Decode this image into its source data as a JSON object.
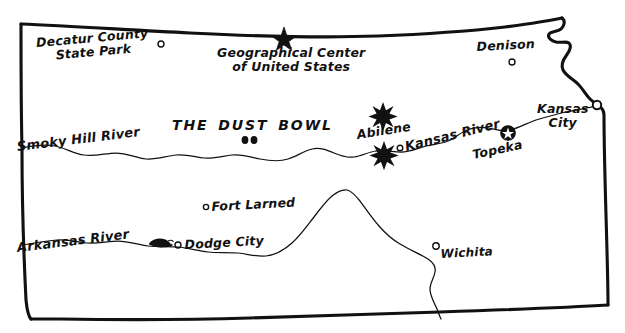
{
  "map": {
    "title": "Kansas",
    "ink_color": "#111111",
    "paper_color": "#ffffff",
    "places": [
      {
        "id": "decatur-county-state-park",
        "label_line1": "Decatur County",
        "label_line2": "State Park",
        "marker": "open-circle",
        "marker_x": 161,
        "marker_y": 44,
        "label_x": 38,
        "label_y": 36
      },
      {
        "id": "geographical-center",
        "label_line1": "Geographical Center",
        "label_line2": "of United States",
        "marker": "solid-star",
        "marker_x": 284,
        "marker_y": 36,
        "label_x": 217,
        "label_y": 46
      },
      {
        "id": "denison",
        "label_line1": "Denison",
        "marker": "open-circle",
        "marker_x": 512,
        "marker_y": 62,
        "label_x": 477,
        "label_y": 40
      },
      {
        "id": "abilene",
        "label_line1": "Abilene",
        "marker": "open-circle",
        "marker_x": 400,
        "marker_y": 148,
        "label_x": 358,
        "label_y": 128
      },
      {
        "id": "topeka",
        "label_line1": "Topeka",
        "marker": "circled-star",
        "marker_x": 508,
        "marker_y": 133,
        "label_x": 474,
        "label_y": 148
      },
      {
        "id": "kansas-city",
        "label_line1": "Kansas",
        "label_line2": "City",
        "marker": "open-circle",
        "marker_x": 597,
        "marker_y": 105,
        "label_x": 537,
        "label_y": 102
      },
      {
        "id": "fort-larned",
        "label_line1": "Fort Larned",
        "marker": "open-circle",
        "marker_x": 206,
        "marker_y": 207,
        "label_x": 212,
        "label_y": 200
      },
      {
        "id": "dodge-city",
        "label_line1": "Dodge City",
        "marker": "open-circle",
        "marker_x": 178,
        "marker_y": 245,
        "label_x": 185,
        "label_y": 238
      },
      {
        "id": "wichita",
        "label_line1": "Wichita",
        "marker": "open-circle",
        "marker_x": 436,
        "marker_y": 246,
        "label_x": 441,
        "label_y": 248
      }
    ],
    "rivers": [
      {
        "id": "smoky-hill-river",
        "label": "Smoky Hill River",
        "label_x": 18,
        "label_y": 140
      },
      {
        "id": "kansas-river",
        "label": "Kansas River",
        "label_x": 407,
        "label_y": 140
      },
      {
        "id": "arkansas-river",
        "label": "Arkansas River",
        "label_x": 18,
        "label_y": 241
      }
    ],
    "regions": [
      {
        "id": "the-dust-bowl",
        "label": "THE DUST BOWL",
        "label_x": 172,
        "label_y": 118,
        "marker": "two-dots",
        "marker_x": 245,
        "marker_y": 140
      }
    ],
    "symbols": [
      {
        "id": "starburst-upper",
        "kind": "starburst",
        "x": 383,
        "y": 113
      },
      {
        "id": "starburst-lower",
        "kind": "starburst",
        "x": 384,
        "y": 152
      },
      {
        "id": "buffalo",
        "kind": "buffalo",
        "x": 159,
        "y": 243
      }
    ]
  }
}
